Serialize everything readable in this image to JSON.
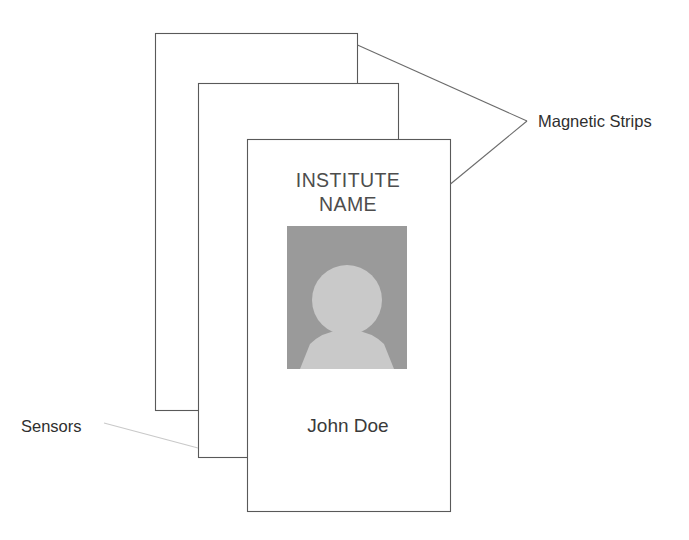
{
  "diagram": {
    "background_color": "#ffffff",
    "card_stack": {
      "count": 3,
      "outline_color": "#595959",
      "fill_color": "#ffffff",
      "cards": [
        {
          "id": "back-card",
          "label": ""
        },
        {
          "id": "middle-card",
          "label": ""
        },
        {
          "id": "front-card",
          "label": ""
        }
      ]
    },
    "front_card": {
      "title_line_1": "INSTITUTE",
      "title_line_2": "NAME",
      "holder_name": "John Doe",
      "title_color": "#4d4d4d",
      "name_color": "#3a3a3a",
      "photo": {
        "name": "person-silhouette-photo",
        "background_color": "#9a9a9a",
        "figure_color": "#c9c9c9"
      }
    },
    "annotations": [
      {
        "id": "magnetic-strips",
        "label": "Magnetic Strips",
        "leader_color": "#6b6b6b",
        "points_to": [
          "back-card-top-right-corner",
          "front-card-top-right-corner"
        ]
      },
      {
        "id": "sensors",
        "label": "Sensors",
        "leader_color": "#c9c9c9",
        "points_to": [
          "middle-card-left-edge"
        ]
      }
    ]
  }
}
